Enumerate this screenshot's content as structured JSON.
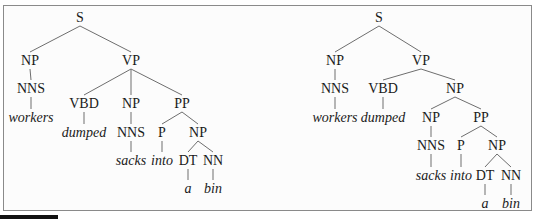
{
  "figure": {
    "sentence": [
      "workers",
      "dumped",
      "sacks",
      "into",
      "a",
      "bin"
    ]
  },
  "trees": [
    {
      "id": "left",
      "attachment": "PP attached to VP",
      "nodes": [
        {
          "id": "S",
          "label": "S",
          "x": 80,
          "y": 22,
          "type": "cat"
        },
        {
          "id": "NP1",
          "label": "NP",
          "x": 30,
          "y": 65,
          "type": "cat"
        },
        {
          "id": "VP",
          "label": "VP",
          "x": 131,
          "y": 65,
          "type": "cat"
        },
        {
          "id": "NNS1",
          "label": "NNS",
          "x": 31,
          "y": 93,
          "type": "cat"
        },
        {
          "id": "w1",
          "label": "workers",
          "x": 31,
          "y": 122,
          "type": "word"
        },
        {
          "id": "VBD",
          "label": "VBD",
          "x": 84,
          "y": 108,
          "type": "cat"
        },
        {
          "id": "NP2",
          "label": "NP",
          "x": 131,
          "y": 108,
          "type": "cat"
        },
        {
          "id": "PP",
          "label": "PP",
          "x": 182,
          "y": 108,
          "type": "cat"
        },
        {
          "id": "w2",
          "label": "dumped",
          "x": 84,
          "y": 137,
          "type": "word"
        },
        {
          "id": "NNS2",
          "label": "NNS",
          "x": 131,
          "y": 137,
          "type": "cat"
        },
        {
          "id": "P",
          "label": "P",
          "x": 162,
          "y": 137,
          "type": "cat"
        },
        {
          "id": "NP3",
          "label": "NP",
          "x": 198,
          "y": 137,
          "type": "cat"
        },
        {
          "id": "w3",
          "label": "sacks",
          "x": 131,
          "y": 165,
          "type": "word"
        },
        {
          "id": "w4",
          "label": "into",
          "x": 162,
          "y": 165,
          "type": "word"
        },
        {
          "id": "DT",
          "label": "DT",
          "x": 188,
          "y": 165,
          "type": "cat"
        },
        {
          "id": "NN",
          "label": "NN",
          "x": 213,
          "y": 165,
          "type": "cat"
        },
        {
          "id": "w5",
          "label": "a",
          "x": 188,
          "y": 193,
          "type": "word"
        },
        {
          "id": "w6",
          "label": "bin",
          "x": 213,
          "y": 193,
          "type": "word"
        }
      ],
      "edges": [
        [
          "S",
          "NP1"
        ],
        [
          "S",
          "VP"
        ],
        [
          "NP1",
          "NNS1"
        ],
        [
          "NNS1",
          "w1"
        ],
        [
          "VP",
          "VBD"
        ],
        [
          "VP",
          "NP2"
        ],
        [
          "VP",
          "PP"
        ],
        [
          "VBD",
          "w2"
        ],
        [
          "NP2",
          "NNS2"
        ],
        [
          "NNS2",
          "w3"
        ],
        [
          "PP",
          "P"
        ],
        [
          "PP",
          "NP3"
        ],
        [
          "P",
          "w4"
        ],
        [
          "NP3",
          "DT"
        ],
        [
          "NP3",
          "NN"
        ],
        [
          "DT",
          "w5"
        ],
        [
          "NN",
          "w6"
        ]
      ]
    },
    {
      "id": "right",
      "attachment": "PP attached to object NP",
      "nodes": [
        {
          "id": "S",
          "label": "S",
          "x": 379,
          "y": 22,
          "type": "cat"
        },
        {
          "id": "NP1",
          "label": "NP",
          "x": 335,
          "y": 65,
          "type": "cat"
        },
        {
          "id": "VP",
          "label": "VP",
          "x": 421,
          "y": 65,
          "type": "cat"
        },
        {
          "id": "NNS1",
          "label": "NNS",
          "x": 335,
          "y": 93,
          "type": "cat"
        },
        {
          "id": "w1",
          "label": "workers",
          "x": 335,
          "y": 122,
          "type": "word"
        },
        {
          "id": "VBD",
          "label": "VBD",
          "x": 383,
          "y": 93,
          "type": "cat"
        },
        {
          "id": "NP2",
          "label": "NP",
          "x": 455,
          "y": 93,
          "type": "cat"
        },
        {
          "id": "w2",
          "label": "dumped",
          "x": 383,
          "y": 122,
          "type": "word"
        },
        {
          "id": "NP3",
          "label": "NP",
          "x": 431,
          "y": 122,
          "type": "cat"
        },
        {
          "id": "PP",
          "label": "PP",
          "x": 481,
          "y": 122,
          "type": "cat"
        },
        {
          "id": "NNS2",
          "label": "NNS",
          "x": 431,
          "y": 150,
          "type": "cat"
        },
        {
          "id": "P",
          "label": "P",
          "x": 461,
          "y": 150,
          "type": "cat"
        },
        {
          "id": "NP4",
          "label": "NP",
          "x": 497,
          "y": 150,
          "type": "cat"
        },
        {
          "id": "w3",
          "label": "sacks",
          "x": 431,
          "y": 180,
          "type": "word"
        },
        {
          "id": "w4",
          "label": "into",
          "x": 461,
          "y": 180,
          "type": "word"
        },
        {
          "id": "DT",
          "label": "DT",
          "x": 485,
          "y": 180,
          "type": "cat"
        },
        {
          "id": "NN",
          "label": "NN",
          "x": 511,
          "y": 180,
          "type": "cat"
        },
        {
          "id": "w5",
          "label": "a",
          "x": 485,
          "y": 208,
          "type": "word"
        },
        {
          "id": "w6",
          "label": "bin",
          "x": 511,
          "y": 208,
          "type": "word"
        }
      ],
      "edges": [
        [
          "S",
          "NP1"
        ],
        [
          "S",
          "VP"
        ],
        [
          "NP1",
          "NNS1"
        ],
        [
          "NNS1",
          "w1"
        ],
        [
          "VP",
          "VBD"
        ],
        [
          "VP",
          "NP2"
        ],
        [
          "VBD",
          "w2"
        ],
        [
          "NP2",
          "NP3"
        ],
        [
          "NP2",
          "PP"
        ],
        [
          "NP3",
          "NNS2"
        ],
        [
          "NNS2",
          "w3"
        ],
        [
          "PP",
          "P"
        ],
        [
          "PP",
          "NP4"
        ],
        [
          "P",
          "w4"
        ],
        [
          "NP4",
          "DT"
        ],
        [
          "NP4",
          "NN"
        ],
        [
          "DT",
          "w5"
        ],
        [
          "NN",
          "w6"
        ]
      ]
    }
  ],
  "colors": {
    "frame_border": "#8a8a8a",
    "edge": "#6e6e6e",
    "text": "#1a1a1a"
  }
}
